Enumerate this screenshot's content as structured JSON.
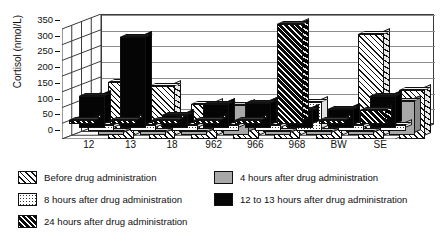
{
  "chart_data": {
    "type": "bar",
    "title": "",
    "subtitle": "",
    "xlabel": "",
    "ylabel": "Cortisol (nmol/L)",
    "ylim": [
      0,
      350
    ],
    "ytick_values": [
      0,
      50,
      100,
      150,
      200,
      250,
      300,
      350
    ],
    "ytick_labels": [
      "0",
      "50",
      "100",
      "150",
      "200",
      "250",
      "300",
      "350"
    ],
    "grid": true,
    "three_d": true,
    "legend_position": "below",
    "categories": [
      "12",
      "13",
      "18",
      "962",
      "966",
      "968",
      "BW",
      "SE"
    ],
    "series": [
      {
        "name": "Before drug administration",
        "key": "before",
        "pattern": "diagonal-hatch-light",
        "color": "#ffffff",
        "values": [
          180,
          170,
          110,
          50,
          115,
          55,
          335,
          155
        ]
      },
      {
        "name": "4 hours after drug administration",
        "key": "h4",
        "pattern": "solid-gray",
        "color": "#a8a8a8",
        "values": [
          15,
          15,
          15,
          95,
          15,
          15,
          15,
          110
        ]
      },
      {
        "name": "8 hours after drug administration",
        "key": "h8",
        "pattern": "dotted",
        "color": "#ffffff",
        "values": [
          20,
          20,
          20,
          20,
          20,
          95,
          20,
          20
        ]
      },
      {
        "name": "12 to 13 hours after drug administration",
        "key": "h12",
        "pattern": "solid-black",
        "color": "#050505",
        "values": [
          100,
          288,
          40,
          75,
          80,
          55,
          60,
          100
        ]
      },
      {
        "name": "24 hours after drug administration",
        "key": "h24",
        "pattern": "diagonal-hatch-dark",
        "color": "#0a0a0a",
        "values": [
          12,
          12,
          12,
          12,
          12,
          318,
          12,
          45
        ]
      }
    ]
  },
  "axis": {
    "y_title": "Cortisol (nmol/L)",
    "y_ticks": [
      "350",
      "300",
      "250",
      "200",
      "150",
      "100",
      "50",
      "0"
    ],
    "x_ticks": [
      "12",
      "13",
      "18",
      "962",
      "966",
      "968",
      "BW",
      "SE"
    ]
  },
  "legend": {
    "items": [
      {
        "label": "Before drug administration",
        "swatch": "diagonal-hatch-light-swatch"
      },
      {
        "label": "4 hours after drug administration",
        "swatch": "solid-gray-swatch"
      },
      {
        "label": "8 hours after drug administration",
        "swatch": "dotted-swatch"
      },
      {
        "label": "12 to 13 hours after drug administration",
        "swatch": "solid-black-swatch"
      },
      {
        "label": "24 hours after drug administration",
        "swatch": "diagonal-hatch-dark-swatch"
      }
    ]
  }
}
